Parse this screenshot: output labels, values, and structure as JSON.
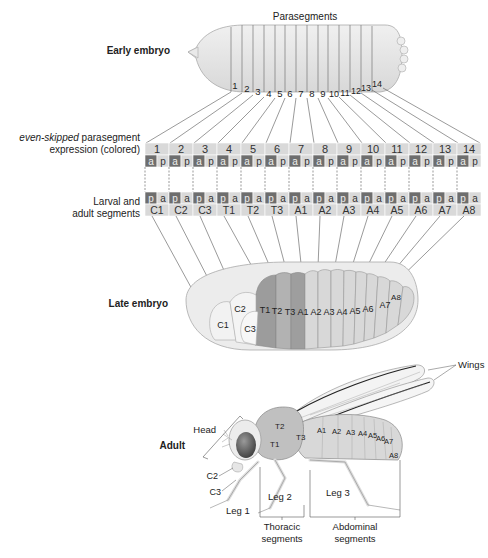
{
  "stages": {
    "early_embryo": "Early embryo",
    "late_embryo": "Late embryo",
    "adult": "Adult"
  },
  "early": {
    "title": "Parasegments",
    "numbers": [
      "1",
      "2",
      "3",
      "4",
      "5",
      "6",
      "7",
      "8",
      "9",
      "10",
      "11",
      "12",
      "13",
      "14"
    ]
  },
  "strip": {
    "label_line1_italic": "even-skipped",
    "label_line1_rest": " parasegment",
    "label_line2": "expression (colored)",
    "parasegments": [
      "1",
      "2",
      "3",
      "4",
      "5",
      "6",
      "7",
      "8",
      "9",
      "10",
      "11",
      "12",
      "13",
      "14"
    ],
    "top_ap": "a",
    "top_pp": "p",
    "segments_label_line1": "Larval and",
    "segments_label_line2": "adult segments",
    "segments": [
      "C1",
      "C2",
      "C3",
      "T1",
      "T2",
      "T3",
      "A1",
      "A2",
      "A3",
      "A4",
      "A5",
      "A6",
      "A7",
      "A8"
    ]
  },
  "late": {
    "segments": [
      "C1",
      "C2",
      "C3",
      "T1",
      "T2",
      "T3",
      "A1",
      "A2",
      "A3",
      "A4",
      "A5",
      "A6",
      "A7",
      "A8"
    ]
  },
  "adult": {
    "wings": "Wings",
    "head": "Head",
    "c2": "C2",
    "c3": "C3",
    "t1": "T1",
    "t2": "T2",
    "t3": "T3",
    "abdomen": [
      "A1",
      "A2",
      "A3",
      "A4",
      "A5",
      "A6",
      "A7",
      "A8"
    ],
    "leg1": "Leg 1",
    "leg2": "Leg 2",
    "leg3": "Leg 3",
    "thoracic1": "Thoracic",
    "thoracic2": "segments",
    "abdominal1": "Abdominal",
    "abdominal2": "segments"
  },
  "colors": {
    "embryo_fill": "#e6e6e6",
    "strip_light": "#d9d9d9",
    "strip_dark": "#6e6e6e",
    "thorax_dark": "#9a9a9a",
    "eye": "#5a5a5a"
  }
}
